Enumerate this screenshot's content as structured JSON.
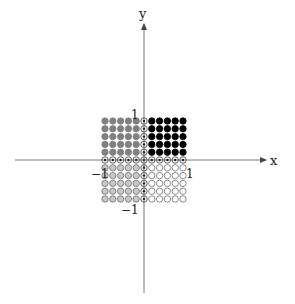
{
  "diagram": {
    "type": "lattice-quadrants",
    "axes": {
      "x_label": "x",
      "y_label": "y",
      "origin_px": [
        144,
        160
      ],
      "x_axis_px": [
        15,
        268
      ],
      "y_axis_px": [
        293,
        20
      ]
    },
    "tick_labels": {
      "y_pos": "1",
      "y_neg": "−1",
      "x_pos": "1",
      "x_neg": "−1"
    },
    "grid": {
      "cols": 11,
      "rows": 11,
      "spacing_px": 7.8,
      "dot_radius_px": 3.2,
      "axis_index": 5
    },
    "quadrant_styles": {
      "top_left": {
        "fill": "#808080",
        "stroke": "#808080",
        "desc": "gray filled dots"
      },
      "top_right": {
        "fill": "#000000",
        "stroke": "#000000",
        "desc": "black filled dots"
      },
      "bottom_left": {
        "fill": "#c8c8c8",
        "stroke": "#707070",
        "desc": "light gray dots with gray outline"
      },
      "bottom_right": {
        "fill": "#ffffff",
        "stroke": "#707070",
        "desc": "open white circles"
      },
      "axis": {
        "fill": "#ffffff",
        "stroke": "#333333",
        "center": "#000000",
        "desc": "circles with center dot on axes"
      }
    },
    "colors": {
      "axis_line": "#555555",
      "background": "#ffffff"
    }
  }
}
